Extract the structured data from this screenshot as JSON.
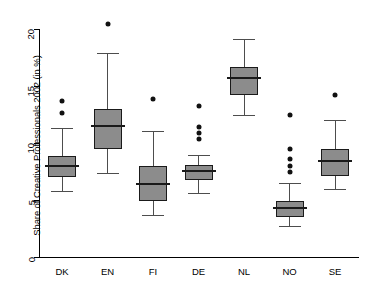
{
  "chart_data": {
    "type": "boxplot",
    "title": "",
    "xlabel": "",
    "ylabel": "Share of Creative Professionals 2002 (in %)",
    "ylim": [
      0,
      21.2
    ],
    "yticks": [
      0,
      5,
      10,
      15,
      20
    ],
    "ytick_labels": [
      "0",
      "5",
      "10",
      "15",
      "20"
    ],
    "grid": false,
    "legend": null,
    "categories": [
      "DK",
      "EN",
      "FI",
      "DE",
      "NL",
      "NO",
      "SE"
    ],
    "boxes": [
      {
        "category": "DK",
        "whisker_low": 5.8,
        "q1": 7.0,
        "median": 8.0,
        "q3": 8.9,
        "whisker_high": 11.3,
        "outliers": [
          13.7,
          12.6
        ]
      },
      {
        "category": "EN",
        "whisker_low": 7.4,
        "q1": 9.5,
        "median": 11.5,
        "q3": 13.0,
        "whisker_high": 17.9,
        "outliers": [
          20.5
        ]
      },
      {
        "category": "FI",
        "whisker_low": 3.7,
        "q1": 4.9,
        "median": 6.4,
        "q3": 8.0,
        "whisker_high": 11.1,
        "outliers": [
          13.9
        ]
      },
      {
        "category": "DE",
        "whisker_low": 5.65,
        "q1": 6.8,
        "median": 7.55,
        "q3": 8.1,
        "whisker_high": 8.95,
        "outliers": [
          13.3,
          11.4,
          10.9,
          10.4
        ]
      },
      {
        "category": "NL",
        "whisker_low": 12.5,
        "q1": 14.2,
        "median": 15.7,
        "q3": 16.7,
        "whisker_high": 19.1,
        "outliers": []
      },
      {
        "category": "NO",
        "whisker_low": 2.7,
        "q1": 3.5,
        "median": 4.3,
        "q3": 4.9,
        "whisker_high": 6.5,
        "outliers": [
          12.5,
          9.45,
          8.6,
          8.0,
          7.5
        ]
      },
      {
        "category": "SE",
        "whisker_low": 6.0,
        "q1": 7.1,
        "median": 8.4,
        "q3": 9.45,
        "whisker_high": 12.0,
        "outliers": [
          14.2
        ]
      }
    ],
    "colors": {
      "box_fill": "#8c8c8c",
      "box_edge": "#1a1a1a",
      "median": "#1a1a1a",
      "whisker": "#4d4d4d",
      "outlier": "#111111",
      "axis": "#000000",
      "background": "#ffffff"
    }
  }
}
